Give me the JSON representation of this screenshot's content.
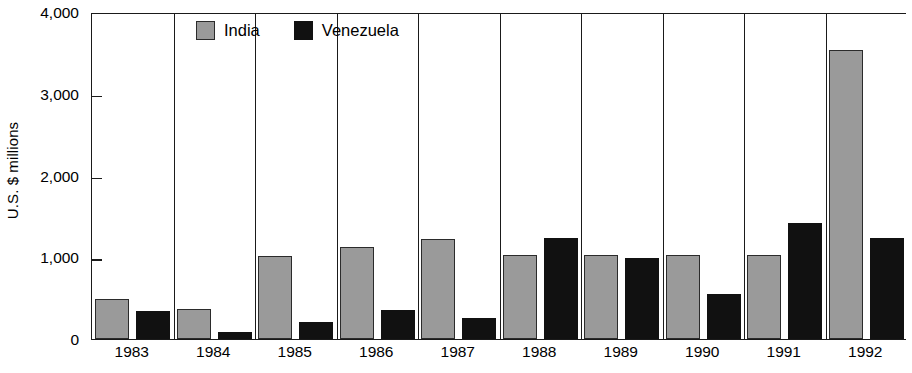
{
  "chart_data": {
    "type": "bar",
    "title": "",
    "subtitle": "",
    "xlabel": "",
    "ylabel": "U.S. $ millions",
    "categories": [
      "1983",
      "1984",
      "1985",
      "1986",
      "1987",
      "1988",
      "1989",
      "1990",
      "1991",
      "1992"
    ],
    "series": [
      {
        "name": "India",
        "color": "#9a9a9a",
        "values": [
          490,
          370,
          1020,
          1120,
          1220,
          1030,
          1030,
          1030,
          1030,
          3530
        ]
      },
      {
        "name": "Venezuela",
        "color": "#111111",
        "values": [
          340,
          80,
          210,
          350,
          260,
          1230,
          990,
          550,
          1420,
          1230
        ]
      }
    ],
    "ylim": [
      0,
      4000
    ],
    "yticks": [
      0,
      1000,
      2000,
      3000,
      4000
    ],
    "ytick_labels": [
      "0",
      "1,000",
      "2,000",
      "3,000",
      "4,000"
    ],
    "grid": false,
    "group_separators": true,
    "legend_position": "top-left-inside"
  },
  "legend": {
    "items": [
      {
        "label": "India",
        "swatch": "india-swatch"
      },
      {
        "label": "Venezuela",
        "swatch": "venezuela-swatch"
      }
    ]
  },
  "axes": {
    "y_title": "U.S. $ millions"
  }
}
